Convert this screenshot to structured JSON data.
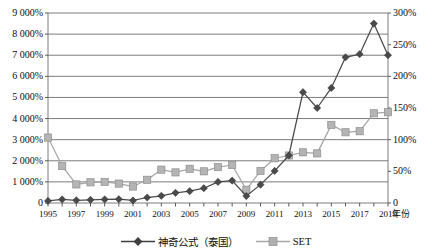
{
  "chart_data": {
    "type": "line",
    "title": "",
    "xlabel": "年份",
    "ylabel": "",
    "grid": true,
    "legend_position": "bottom",
    "x": [
      1995,
      1996,
      1997,
      1998,
      1999,
      2000,
      2001,
      2002,
      2003,
      2004,
      2005,
      2006,
      2007,
      2008,
      2009,
      2010,
      2011,
      2012,
      2013,
      2014,
      2015,
      2016,
      2017,
      2018,
      2019
    ],
    "x_tick_labels": [
      "1995",
      "1997",
      "1999",
      "2001",
      "2003",
      "2005",
      "2007",
      "2009",
      "2011",
      "2013",
      "2015",
      "2017",
      "2019"
    ],
    "x_tick_values": [
      1995,
      1997,
      1999,
      2001,
      2003,
      2005,
      2007,
      2009,
      2011,
      2013,
      2015,
      2017,
      2019
    ],
    "axes": {
      "left": {
        "tick_labels": [
          "9 000%",
          "8 000%",
          "7 000%",
          "6 000%",
          "5 000%",
          "4 000%",
          "3 000%",
          "2 000%",
          "1 000%",
          "0"
        ],
        "tick_values": [
          9000,
          8000,
          7000,
          6000,
          5000,
          4000,
          3000,
          2000,
          1000,
          0
        ],
        "min": 0,
        "max": 9000,
        "unit": "%"
      },
      "right": {
        "tick_labels": [
          "300%",
          "250%",
          "200%",
          "150%",
          "100%",
          "50%",
          "0"
        ],
        "tick_values": [
          300,
          250,
          200,
          150,
          100,
          50,
          0
        ],
        "min": 0,
        "max": 300,
        "unit": "%"
      }
    },
    "series": [
      {
        "name": "神奇公式（泰国）",
        "axis": "left",
        "marker": "diamond",
        "color": "#4a4a4a",
        "values": [
          100,
          170,
          130,
          150,
          170,
          180,
          120,
          260,
          340,
          480,
          560,
          700,
          1000,
          1060,
          330,
          870,
          1520,
          2250,
          5250,
          4500,
          5450,
          6900,
          7050,
          8500,
          7000
        ]
      },
      {
        "name": "SET",
        "axis": "left",
        "marker": "square",
        "color": "#a6a6a6",
        "values": [
          3100,
          1750,
          880,
          980,
          1000,
          920,
          780,
          1100,
          1580,
          1450,
          1620,
          1500,
          1700,
          1800,
          630,
          1520,
          2120,
          2250,
          2400,
          2350,
          3700,
          3350,
          3400,
          4250,
          4300
        ]
      }
    ],
    "series_right_axis_values": {
      "SET_percent_right_axis": [
        103,
        58,
        29,
        33,
        33,
        31,
        26,
        37,
        53,
        48,
        54,
        50,
        57,
        60,
        21,
        51,
        71,
        75,
        80,
        78,
        123,
        112,
        113,
        142,
        143
      ]
    }
  },
  "legend": {
    "entries": [
      {
        "label": "神奇公式（泰国）",
        "marker": "diamond",
        "color": "#3f3f3f"
      },
      {
        "label": "SET",
        "marker": "square",
        "color": "#a6a6a6"
      }
    ]
  }
}
